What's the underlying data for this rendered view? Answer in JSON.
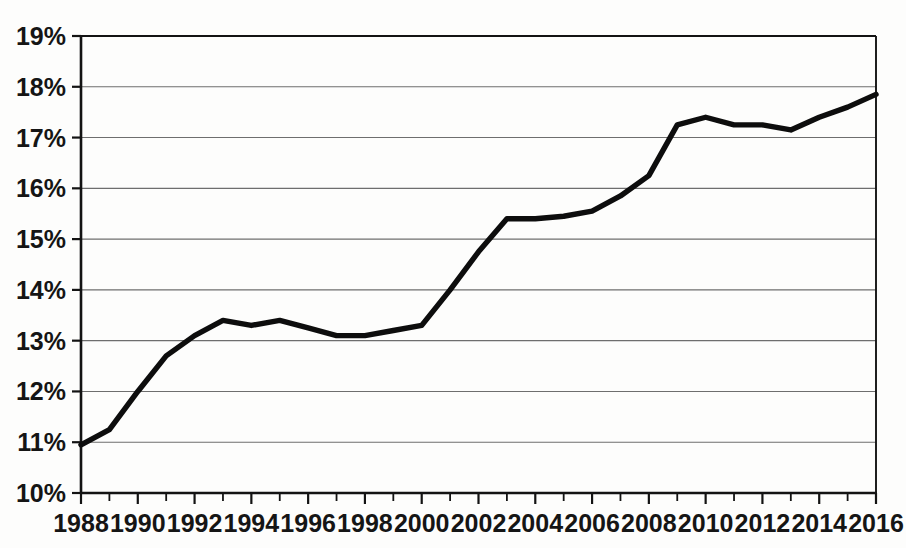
{
  "chart_data": {
    "type": "line",
    "title": "",
    "subtitle": "",
    "xlabel": "",
    "ylabel": "",
    "xlim": [
      1988,
      2016
    ],
    "ylim": [
      10,
      19
    ],
    "grid": true,
    "legend": false,
    "legend_position": "none",
    "y_tick_labels": [
      "19%",
      "18%",
      "17%",
      "16%",
      "15%",
      "14%",
      "13%",
      "12%",
      "11%",
      "10%"
    ],
    "y_tick_values": [
      19,
      18,
      17,
      16,
      15,
      14,
      13,
      12,
      11,
      10
    ],
    "x_tick_labels": [
      "1988",
      "1990",
      "1992",
      "1994",
      "1996",
      "1998",
      "2000",
      "2002",
      "2004",
      "2006",
      "2008",
      "2010",
      "2012",
      "2014",
      "2016"
    ],
    "x_tick_values": [
      1988,
      1990,
      1992,
      1994,
      1996,
      1998,
      2000,
      2002,
      2004,
      2006,
      2008,
      2010,
      2012,
      2014,
      2016
    ],
    "x_minor_tick_values": [
      1989,
      1991,
      1993,
      1995,
      1997,
      1999,
      2001,
      2003,
      2005,
      2007,
      2009,
      2011,
      2013,
      2015
    ],
    "series": [
      {
        "name": "Share",
        "color": "#0d0d0d",
        "x": [
          1988,
          1989,
          1990,
          1991,
          1992,
          1993,
          1994,
          1995,
          1996,
          1997,
          1998,
          1999,
          2000,
          2001,
          2002,
          2003,
          2004,
          2005,
          2006,
          2007,
          2008,
          2009,
          2010,
          2011,
          2012,
          2013,
          2014,
          2015,
          2016
        ],
        "values": [
          10.95,
          11.25,
          12.0,
          12.7,
          13.1,
          13.4,
          13.3,
          13.4,
          13.25,
          13.1,
          13.1,
          13.2,
          13.3,
          14.0,
          14.75,
          15.4,
          15.4,
          15.45,
          15.55,
          15.85,
          16.25,
          17.25,
          17.4,
          17.25,
          17.25,
          17.15,
          17.4,
          17.6,
          17.85
        ]
      }
    ]
  },
  "axes": {
    "y_axis_name": "percent-axis",
    "x_axis_name": "year-axis"
  }
}
